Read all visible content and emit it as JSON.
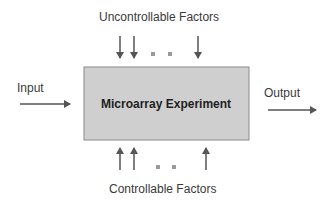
{
  "diagram": {
    "top_label": "Uncontrollable Factors",
    "bottom_label": "Controllable Factors",
    "input_label": "Input",
    "output_label": "Output",
    "box_label": "Microarray Experiment",
    "colors": {
      "box_fill": "#cfcfcf",
      "box_border": "#8a8a8a",
      "arrow": "#555555",
      "dots": "#9a9a9a",
      "text": "#3a3a3a"
    },
    "top_arrows": [
      {
        "x": 120,
        "y1": 36,
        "y2": 58
      },
      {
        "x": 134,
        "y1": 36,
        "y2": 58
      },
      {
        "x": 198,
        "y1": 36,
        "y2": 58
      }
    ],
    "top_dots": [
      {
        "x": 153,
        "y": 54
      },
      {
        "x": 170,
        "y": 54
      }
    ],
    "bottom_arrows": [
      {
        "x": 120,
        "y1": 170,
        "y2": 148
      },
      {
        "x": 134,
        "y1": 170,
        "y2": 148
      },
      {
        "x": 206,
        "y1": 170,
        "y2": 148
      }
    ],
    "bottom_dots": [
      {
        "x": 158,
        "y": 167
      },
      {
        "x": 174,
        "y": 167
      }
    ]
  }
}
